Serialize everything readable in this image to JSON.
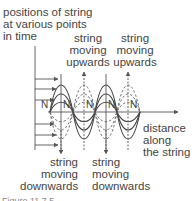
{
  "diagram": {
    "title_label": [
      "positions of string",
      "at various points",
      "in time"
    ],
    "up_label_1": [
      "string",
      "moving",
      "upwards"
    ],
    "up_label_2": [
      "string",
      "moving",
      "upwards"
    ],
    "down_label_1": [
      "string",
      "moving",
      "downwards"
    ],
    "down_label_2": [
      "string",
      "moving",
      "downwards"
    ],
    "axis_label": [
      "distance",
      "along",
      "the string"
    ],
    "node_label": "N",
    "caption": "Figure 11.7.5"
  }
}
